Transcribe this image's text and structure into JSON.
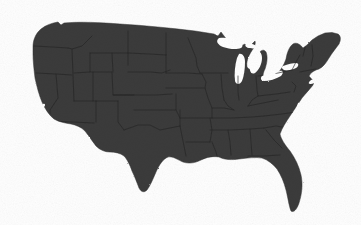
{
  "figure": {
    "projection_hint": "Albers-like conic projection",
    "caption": ""
  },
  "canvas": {
    "width": 361,
    "height": 225,
    "background_color": "#fefefe"
  },
  "map_data": {
    "type": "choropleth-silhouette",
    "region": "United States (contiguous 48 states)",
    "fill_color": "#3b3b3b",
    "border_color": "#252525",
    "border_width": 0.7,
    "outline_color": "#333333",
    "water_color": "#ffffff",
    "states_shown": true,
    "state_labels_shown": false,
    "legend_shown": false,
    "graticule_shown": false,
    "landmarks": [
      {
        "name": "Great Lakes",
        "rendered_as": "white cutout"
      },
      {
        "name": "Florida peninsula",
        "rendered_as": "land"
      },
      {
        "name": "Maine",
        "rendered_as": "land"
      },
      {
        "name": "Texas Gulf coast",
        "rendered_as": "land"
      },
      {
        "name": "California coastline",
        "rendered_as": "land"
      }
    ],
    "bounding_box_px": {
      "left": 30,
      "top": 21,
      "right": 341,
      "bottom": 213
    }
  }
}
